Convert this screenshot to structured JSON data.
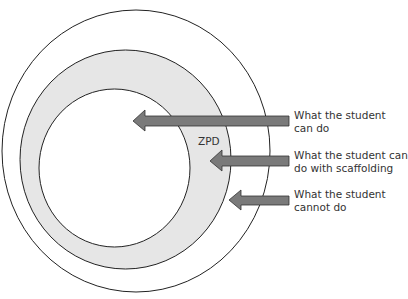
{
  "diagram": {
    "center_label": "ZPD",
    "colors": {
      "zpd_fill": "#e6e6e6",
      "arrow_fill": "#7a7a7a",
      "line": "#222222",
      "text": "#333333"
    },
    "labels": [
      {
        "line1": "What the student",
        "line2": "can do"
      },
      {
        "line1": "What the student can",
        "line2": "do with scaffolding"
      },
      {
        "line1": "What the student",
        "line2": "cannot do"
      }
    ]
  }
}
